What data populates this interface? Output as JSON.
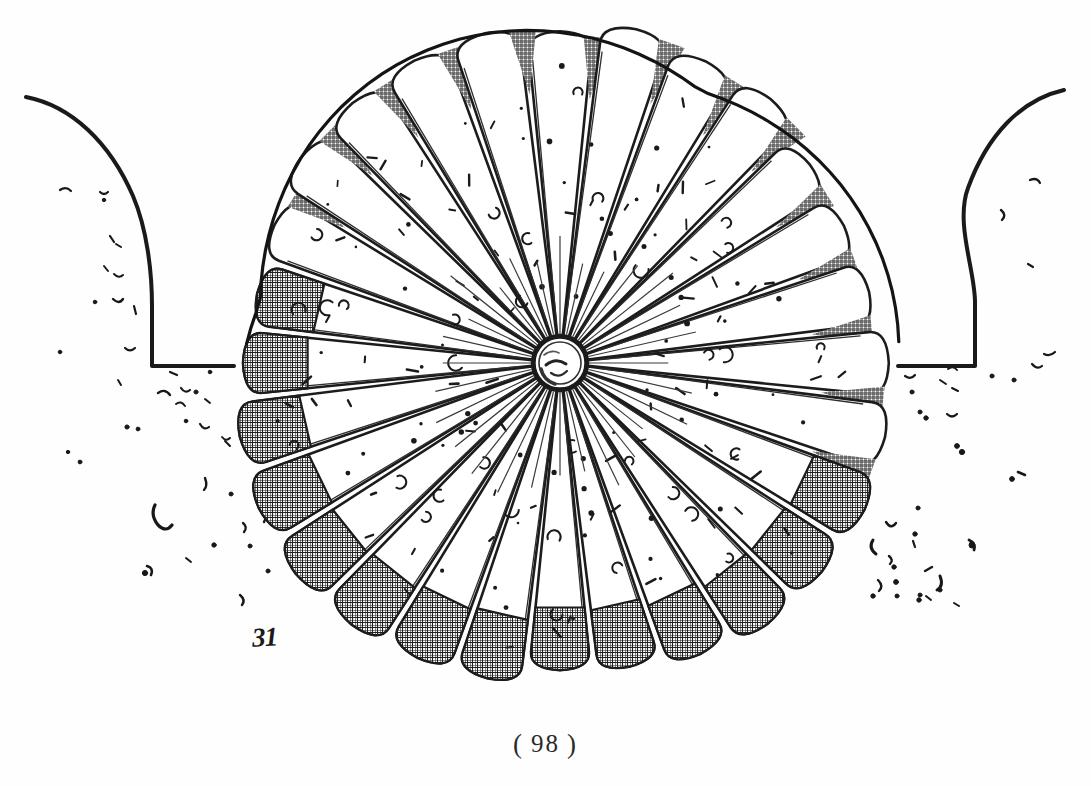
{
  "plate": {
    "title": "Microscopic rosette body in a ditch — antique engraved plate",
    "description": "Monochrome line engraving of a circular radiating rosette of club-shaped rays resting in a trench between two sloping banks, with scattered granular debris.",
    "background_color": "#fefefe",
    "ink_color": "#1a1a1a",
    "width": 1091,
    "height": 786
  },
  "figure": {
    "number_label": "31",
    "number_x": 252,
    "number_y": 622,
    "ray_count": 28,
    "center_x": 560,
    "center_y": 363,
    "outer_radius": 340,
    "hub_radius": 26,
    "shaded_side": "left",
    "shaded_ray_start": 9,
    "shaded_ray_end": 22
  },
  "ground": {
    "left_bank": {
      "crest_x": 28,
      "crest_y": 98,
      "wall_x": 152,
      "floor_y": 366,
      "floor_end_x": 232
    },
    "right_bank": {
      "crest_x": 1063,
      "crest_y": 90,
      "wall_x": 975,
      "floor_y": 366,
      "floor_end_x": 900
    }
  },
  "page": {
    "open_paren": "(",
    "number": "98",
    "close_paren": ")",
    "full_label": "( 98 )"
  },
  "legend": {
    "figure_caption": "31",
    "page_caption": "( 98 )"
  }
}
